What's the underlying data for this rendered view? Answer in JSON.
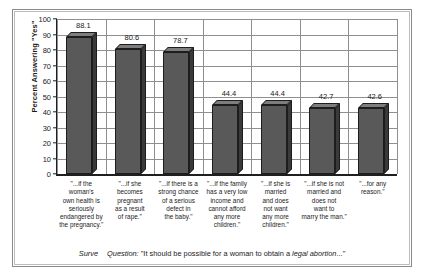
{
  "chart_data": {
    "type": "bar",
    "title": "",
    "subtitle": "",
    "xlabel": "",
    "ylabel": "Percent Answering \"Yes\"",
    "ylim": [
      0,
      100
    ],
    "yticks": [
      0,
      10,
      20,
      30,
      40,
      50,
      60,
      70,
      80,
      90,
      100
    ],
    "ytick_labels": [
      "0",
      "10",
      "20",
      "30",
      "40",
      "50",
      "60",
      "70",
      "80",
      "90",
      "100"
    ],
    "grid": "both",
    "legend": "none",
    "categories": [
      "\"...if the woman's own health is seriously endangered by the pregnancy.\"",
      "\"...if she becomes pregnant as a result of rape.\"",
      "\"...if there is a strong chance of a serious defect in the baby.\"",
      "\"...if the family has a very low income and cannot afford any more children.\"",
      "\"...if she is married and does not want any more children.\"",
      "\"...if she is not married and does not want to marry the man.\"",
      "\"...for any reason.\""
    ],
    "category_lines": [
      [
        "\"...if the",
        "woman's",
        "own health is",
        "seriously",
        "endangered by",
        "the pregnancy.\""
      ],
      [
        "\"...if she",
        "becomes",
        "pregnant",
        "as a result",
        "of rape.\""
      ],
      [
        "\"...if there is a",
        "strong chance",
        "of a serious",
        "defect in",
        "the baby.\""
      ],
      [
        "\"...if the family",
        "has a very low",
        "income and",
        "cannot afford",
        "any more",
        "children.\""
      ],
      [
        "\"...if she is",
        "married",
        "and does",
        "not want",
        "any more",
        "children.\""
      ],
      [
        "\"...if she is not",
        "married and",
        "does not",
        "want to",
        "marry the man.\""
      ],
      [
        "\"...for any",
        "reason.\""
      ]
    ],
    "values": [
      88.1,
      80.6,
      78.7,
      44.4,
      44.4,
      42.7,
      42.6
    ],
    "value_labels": [
      "88.1",
      "80.6",
      "78.7",
      "44.4",
      "44.4",
      "42.7",
      "42.6"
    ],
    "bar_face_color": "#595959",
    "bar_top_color": "#7d7d7d",
    "bar_side_color": "#3a3a3a",
    "grid_color": "#8f8f8f",
    "axis_color": "#1f1f1f"
  },
  "caption": {
    "source": "Surve",
    "question_word": "Question:",
    "text_before": "\"It should be possible for a woman to obtain a",
    "emphasis": "legal abortion",
    "text_after": "...\""
  }
}
